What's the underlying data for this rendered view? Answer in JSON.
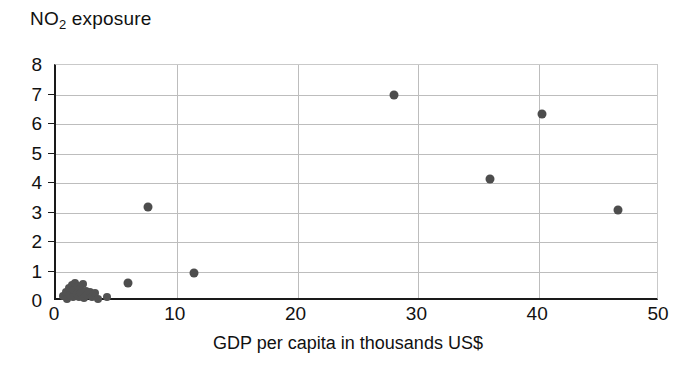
{
  "chart_data": {
    "type": "scatter",
    "title": "NO2 exposure",
    "title_parts": {
      "pre": "NO",
      "sub": "2",
      "post": " exposure"
    },
    "xlabel": "GDP per capita in thousands US$",
    "ylabel": "NO2 exposure",
    "xlim": [
      0,
      50
    ],
    "ylim": [
      0,
      8
    ],
    "xticks": [
      0,
      10,
      20,
      30,
      40,
      50
    ],
    "yticks": [
      0,
      1,
      2,
      3,
      4,
      5,
      6,
      7,
      8
    ],
    "grid": true,
    "grid_axis": "both",
    "legend": null,
    "marker": {
      "shape": "circle",
      "color": "#4d4d4d",
      "size": 9
    },
    "points": [
      {
        "x": 0.6,
        "y": 0.18
      },
      {
        "x": 0.8,
        "y": 0.32
      },
      {
        "x": 0.9,
        "y": 0.08
      },
      {
        "x": 1.1,
        "y": 0.45
      },
      {
        "x": 1.2,
        "y": 0.22
      },
      {
        "x": 1.3,
        "y": 0.55
      },
      {
        "x": 1.4,
        "y": 0.12
      },
      {
        "x": 1.5,
        "y": 0.38
      },
      {
        "x": 1.6,
        "y": 0.62
      },
      {
        "x": 1.7,
        "y": 0.25
      },
      {
        "x": 1.8,
        "y": 0.5
      },
      {
        "x": 1.9,
        "y": 0.15
      },
      {
        "x": 2.0,
        "y": 0.42
      },
      {
        "x": 2.1,
        "y": 0.28
      },
      {
        "x": 2.2,
        "y": 0.58
      },
      {
        "x": 2.3,
        "y": 0.1
      },
      {
        "x": 2.5,
        "y": 0.35
      },
      {
        "x": 2.6,
        "y": 0.2
      },
      {
        "x": 2.8,
        "y": 0.3
      },
      {
        "x": 3.0,
        "y": 0.14
      },
      {
        "x": 3.2,
        "y": 0.26
      },
      {
        "x": 3.5,
        "y": 0.08
      },
      {
        "x": 4.2,
        "y": 0.12
      },
      {
        "x": 6.0,
        "y": 0.6
      },
      {
        "x": 7.6,
        "y": 3.2
      },
      {
        "x": 11.4,
        "y": 0.95
      },
      {
        "x": 28.0,
        "y": 7.0
      },
      {
        "x": 35.9,
        "y": 4.15
      },
      {
        "x": 40.2,
        "y": 6.35
      },
      {
        "x": 46.5,
        "y": 3.1
      }
    ]
  }
}
